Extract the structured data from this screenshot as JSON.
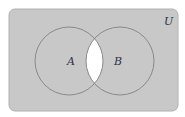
{
  "diagram": {
    "type": "venn",
    "universe_label": "U",
    "sets": [
      {
        "label": "A"
      },
      {
        "label": "B"
      }
    ],
    "shaded_region": "complement of A intersect B",
    "colors": {
      "shade": "#c8c8c8",
      "unshaded": "#ffffff",
      "outline": "#8a8a8a",
      "text": "#333333"
    }
  }
}
